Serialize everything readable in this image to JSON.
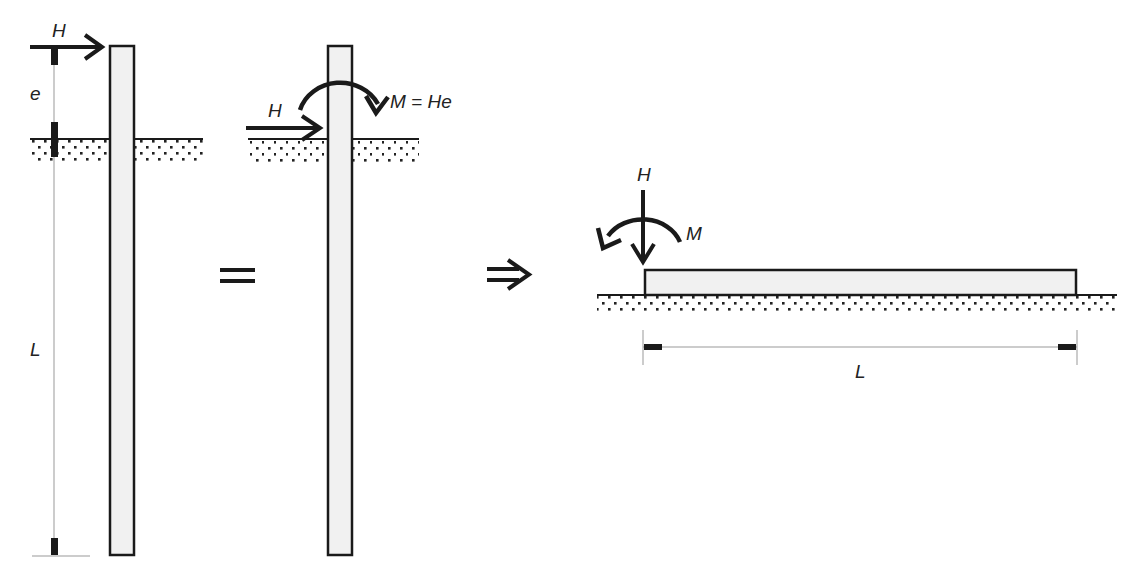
{
  "figure": {
    "panel_left": {
      "force_label": "H",
      "eccentricity_label": "e",
      "length_label": "L"
    },
    "equals_symbol": "=",
    "panel_middle": {
      "force_label": "H",
      "moment_label": "M = He"
    },
    "implies_symbol": "⇒",
    "panel_right": {
      "force_label": "H",
      "moment_label": "M",
      "length_label": "L"
    }
  },
  "colors": {
    "stroke": "#1a1a1a",
    "pile_fill": "#f1f1f1",
    "dim_line": "#999999",
    "soil_dot": "#222222"
  }
}
